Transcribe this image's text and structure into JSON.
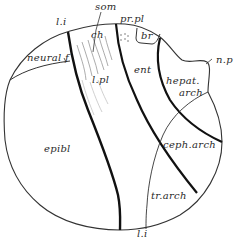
{
  "figure": {
    "labels": {
      "l_i_top": "l.i",
      "som": "som",
      "pr_pl": "pr.pl",
      "ch": "ch",
      "br": "br",
      "neural_f": "neural f",
      "n_p": "n.p",
      "l_pl": "l.pl",
      "ent": "ent",
      "hepat_arch_1": "hepat.",
      "hepat_arch_2": "arch",
      "epibl": "epibl",
      "ceph_arch": "ceph.arch",
      "tr_arch": "tr.arch",
      "l_i_bottom": "l.i"
    },
    "colors": {
      "ink": "#1e1e1e",
      "background": "#ffffff"
    }
  }
}
